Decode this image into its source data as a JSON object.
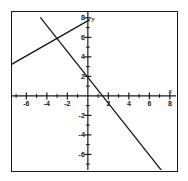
{
  "figure": {
    "name": "cartesian-line-graph",
    "background_color": "#ffffff",
    "frame_color": "#1a1a1a",
    "line_color": "#1a1a1a"
  },
  "chart_data": {
    "type": "line",
    "title": "",
    "xlabel": "x",
    "ylabel": "y",
    "grid": false,
    "legend": "none",
    "xlim": [
      -7.4,
      8.6
    ],
    "ylim": [
      -7.6,
      8.6
    ],
    "xticks": [
      -6,
      -4,
      -2,
      2,
      4,
      6,
      8
    ],
    "yticks": [
      8,
      6,
      4,
      2,
      -2,
      -4,
      -6
    ],
    "xtick_labels": [
      "-6",
      "-4",
      "-2",
      "2",
      "4",
      "6",
      "8"
    ],
    "ytick_labels": [
      "8",
      "6",
      "4",
      "2",
      "-2",
      "-4",
      "-6"
    ],
    "minor_tick_step": 1,
    "series": [
      {
        "name": "ascending-line",
        "slope": 0.6,
        "intercept": 7.7,
        "points": [
          [
            -7.4,
            3.26
          ],
          [
            0.15,
            7.79
          ]
        ]
      },
      {
        "name": "descending-line",
        "slope": -1.33,
        "intercept": 1.9,
        "points": [
          [
            -4.6,
            8.0
          ],
          [
            0,
            1.9
          ],
          [
            1.43,
            0
          ],
          [
            7.6,
            -8.2
          ]
        ]
      }
    ],
    "intersection": [
      -2.2,
      5.5
    ]
  },
  "axis_labels": {
    "x_axis_name": "x",
    "y_axis_name": "y"
  }
}
